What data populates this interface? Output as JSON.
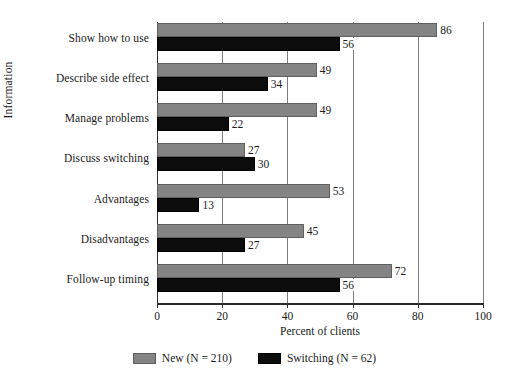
{
  "chart_data": {
    "type": "bar",
    "orientation": "horizontal",
    "title": "",
    "xlabel": "Percent of clients",
    "ylabel": "Information",
    "xlim": [
      0,
      100
    ],
    "xticks": [
      0,
      20,
      40,
      60,
      80,
      100
    ],
    "grid": "vertical",
    "legend_position": "bottom-center",
    "categories": [
      "Show how to use",
      "Describe side effect",
      "Manage problems",
      "Discuss switching",
      "Advantages",
      "Disadvantages",
      "Follow-up timing"
    ],
    "series": [
      {
        "name": "New (N = 210)",
        "short_name": "New",
        "color": "#848484",
        "values": [
          86,
          49,
          49,
          27,
          53,
          45,
          72
        ]
      },
      {
        "name": "Switching (N = 62)",
        "short_name": "Switching",
        "color": "#0c0c0c",
        "values": [
          56,
          34,
          22,
          30,
          13,
          27,
          56
        ]
      }
    ]
  },
  "legend": {
    "entries": [
      {
        "label": "New (N = 210)"
      },
      {
        "label": "Switching (N = 62)"
      }
    ]
  },
  "axes": {
    "x_title": "Percent of clients",
    "y_title": "Information",
    "x_tick_labels": [
      "0",
      "20",
      "40",
      "60",
      "80",
      "100"
    ]
  }
}
